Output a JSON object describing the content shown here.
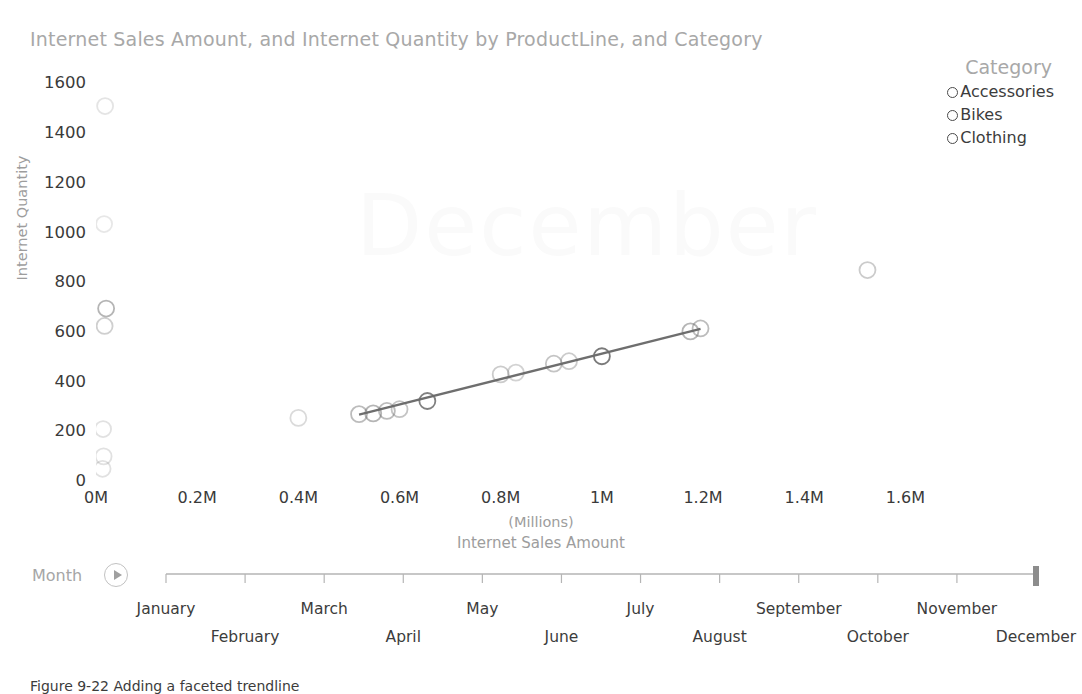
{
  "chart_title": "Internet Sales Amount, and Internet Quantity by ProductLine, and Category",
  "watermark": "December",
  "legend": {
    "title": "Category",
    "items": [
      {
        "label": "Accessories",
        "marker": "open-circle"
      },
      {
        "label": "Bikes",
        "marker": "open-circle"
      },
      {
        "label": "Clothing",
        "marker": "open-circle"
      }
    ]
  },
  "axes": {
    "y_title": "Internet Quantity",
    "y_ticks": [
      "0",
      "200",
      "400",
      "600",
      "800",
      "1000",
      "1200",
      "1400",
      "1600"
    ],
    "x_title": "Internet Sales Amount",
    "x_subtitle": "(Millions)",
    "x_ticks": [
      "0M",
      "0.2M",
      "0.4M",
      "0.6M",
      "0.8M",
      "1M",
      "1.2M",
      "1.4M",
      "1.6M"
    ]
  },
  "slider": {
    "label": "Month",
    "play_icon": "play-icon",
    "handle_position_month": "December",
    "months": [
      "January",
      "February",
      "March",
      "April",
      "May",
      "June",
      "July",
      "August",
      "September",
      "October",
      "November",
      "December"
    ]
  },
  "caption": "Figure 9-22  Adding a faceted trendline",
  "colors": {
    "title": "#a8a8a8",
    "tick": "#3a3a3a",
    "axis_title": "#9d9d9d",
    "marker": "#6b6b6b",
    "trail_line": "#6e6e6e",
    "watermark": "#fafafa",
    "slider_track": "#b5b5b5",
    "slider_handle": "#8c8c8c"
  },
  "chart_data": {
    "type": "scatter",
    "title": "Internet Sales Amount, and Internet Quantity by ProductLine, and Category",
    "xlabel": "Internet Sales Amount",
    "ylabel": "Internet Quantity",
    "xlim": [
      0,
      1700000
    ],
    "ylim": [
      0,
      1650
    ],
    "grid": false,
    "legend_position": "top-right",
    "animation_frame": "December",
    "x_tick_values": [
      0,
      200000,
      400000,
      600000,
      800000,
      1000000,
      1200000,
      1400000,
      1600000
    ],
    "y_tick_values": [
      0,
      200,
      400,
      600,
      800,
      1000,
      1200,
      1400,
      1600
    ],
    "series": [
      {
        "name": "Accessories",
        "note": "faint cluster near left axis",
        "points": [
          {
            "x": 18000,
            "y": 1505,
            "opacity": 0.18
          },
          {
            "x": 16000,
            "y": 1030,
            "opacity": 0.16
          },
          {
            "x": 20000,
            "y": 690,
            "opacity": 0.5
          },
          {
            "x": 17000,
            "y": 620,
            "opacity": 0.32
          },
          {
            "x": 14000,
            "y": 205,
            "opacity": 0.2
          },
          {
            "x": 15000,
            "y": 95,
            "opacity": 0.2
          },
          {
            "x": 13000,
            "y": 45,
            "opacity": 0.2
          }
        ]
      },
      {
        "name": "Bikes",
        "note": "animated trail with trendline from ~0.52M to ~1.2M",
        "points": [
          {
            "x": 400000,
            "y": 250,
            "opacity": 0.25
          },
          {
            "x": 520000,
            "y": 265,
            "opacity": 0.45
          },
          {
            "x": 548000,
            "y": 268,
            "opacity": 0.5
          },
          {
            "x": 575000,
            "y": 278,
            "opacity": 0.45
          },
          {
            "x": 600000,
            "y": 285,
            "opacity": 0.4
          },
          {
            "x": 655000,
            "y": 318,
            "opacity": 0.85
          },
          {
            "x": 800000,
            "y": 425,
            "opacity": 0.35
          },
          {
            "x": 830000,
            "y": 432,
            "opacity": 0.3
          },
          {
            "x": 905000,
            "y": 468,
            "opacity": 0.4
          },
          {
            "x": 935000,
            "y": 478,
            "opacity": 0.35
          },
          {
            "x": 1000000,
            "y": 498,
            "opacity": 0.9
          },
          {
            "x": 1175000,
            "y": 598,
            "opacity": 0.5
          },
          {
            "x": 1195000,
            "y": 610,
            "opacity": 0.45
          }
        ]
      },
      {
        "name": "Clothing",
        "note": "isolated faint marker upper right",
        "points": [
          {
            "x": 1525000,
            "y": 845,
            "opacity": 0.35
          }
        ]
      }
    ],
    "trendline": {
      "x_start": 520000,
      "y_start": 263,
      "x_end": 1195000,
      "y_end": 608
    }
  }
}
